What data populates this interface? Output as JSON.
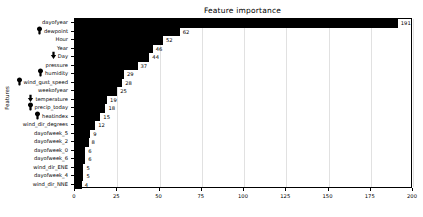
{
  "chart_data": {
    "type": "bar",
    "orientation": "horizontal",
    "title": "Feature importance",
    "xlabel": "",
    "ylabel": "Features",
    "xlim": [
      0,
      200
    ],
    "xticks": [
      0,
      25,
      50,
      75,
      100,
      125,
      150,
      175,
      200
    ],
    "grid": true,
    "legend": false,
    "bar_color": "#000000",
    "categories": [
      "dayofyear",
      "dewpoint",
      "Hour",
      "Year",
      "Day",
      "pressure",
      "humidity",
      "wind_gust_speed",
      "weekofyear",
      "temperature",
      "precip_today",
      "heatindex",
      "wind_dir_degrees",
      "dayofweek_5",
      "dayofweek_2",
      "dayofweek_0",
      "dayofweek_6",
      "wind_dir_ENE",
      "dayofweek_4",
      "wind_dir_NNE"
    ],
    "values": [
      191,
      62,
      52,
      46,
      44,
      37,
      29,
      28,
      25,
      19,
      18,
      15,
      12,
      9,
      8,
      6,
      6,
      5,
      5,
      4
    ]
  },
  "markers": [
    {
      "category": "dewpoint",
      "icon": "cursor-pin-icon"
    },
    {
      "category": "Day",
      "icon": "cursor-arrow-icon"
    },
    {
      "category": "humidity",
      "icon": "cursor-pin-icon"
    },
    {
      "category": "wind_gust_speed",
      "icon": "cursor-pin-icon"
    },
    {
      "category": "temperature",
      "icon": "cursor-arrow-icon"
    },
    {
      "category": "precip_today",
      "icon": "cursor-pin-icon"
    },
    {
      "category": "heatindex",
      "icon": "cursor-pin-icon"
    }
  ]
}
